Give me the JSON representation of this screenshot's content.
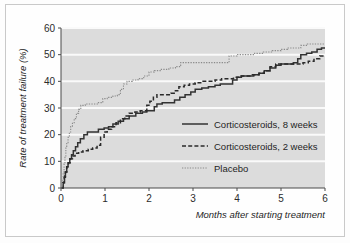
{
  "chart_data": {
    "type": "line",
    "subtype": "kaplan-meier-step",
    "title": "",
    "xlabel": "Months after starting treatment",
    "ylabel": "Rate of treatment failure (%)",
    "xlim": [
      0,
      6
    ],
    "ylim": [
      0,
      60
    ],
    "xticks": [
      0,
      1,
      2,
      3,
      4,
      5,
      6
    ],
    "yticks": [
      0,
      10,
      20,
      30,
      40,
      50,
      60
    ],
    "xtick_labels": [
      "0",
      "1",
      "2",
      "3",
      "4",
      "5",
      "6"
    ],
    "ytick_labels": [
      "0",
      "10",
      "20",
      "30",
      "40",
      "50",
      "60"
    ],
    "grid": "horizontal-white-on-gray",
    "legend_position": "inside-right-lower",
    "plot_background": "#dcdcdc",
    "gridline_color": "#fafafa",
    "series": [
      {
        "name": "Corticosteroids, 8 weeks",
        "style": "solid",
        "color": "#333333",
        "points": [
          [
            0.0,
            0.0
          ],
          [
            0.05,
            2.0
          ],
          [
            0.08,
            4.5
          ],
          [
            0.1,
            6.0
          ],
          [
            0.13,
            8.0
          ],
          [
            0.16,
            9.5
          ],
          [
            0.2,
            11.0
          ],
          [
            0.24,
            12.5
          ],
          [
            0.28,
            14.0
          ],
          [
            0.33,
            15.5
          ],
          [
            0.38,
            17.0
          ],
          [
            0.44,
            18.5
          ],
          [
            0.52,
            20.0
          ],
          [
            0.6,
            21.0
          ],
          [
            0.72,
            21.0
          ],
          [
            0.85,
            22.0
          ],
          [
            0.98,
            22.5
          ],
          [
            1.08,
            23.0
          ],
          [
            1.18,
            24.0
          ],
          [
            1.3,
            25.0
          ],
          [
            1.42,
            26.0
          ],
          [
            1.55,
            27.0
          ],
          [
            1.7,
            28.0
          ],
          [
            1.85,
            28.5
          ],
          [
            1.95,
            29.0
          ],
          [
            2.05,
            29.0
          ],
          [
            2.12,
            30.5
          ],
          [
            2.18,
            31.5
          ],
          [
            2.3,
            32.0
          ],
          [
            2.45,
            32.0
          ],
          [
            2.58,
            33.0
          ],
          [
            2.7,
            34.0
          ],
          [
            2.82,
            35.0
          ],
          [
            2.95,
            36.0
          ],
          [
            3.05,
            37.0
          ],
          [
            3.2,
            37.5
          ],
          [
            3.35,
            38.0
          ],
          [
            3.5,
            38.5
          ],
          [
            3.62,
            39.0
          ],
          [
            3.78,
            39.0
          ],
          [
            3.9,
            40.5
          ],
          [
            4.0,
            41.5
          ],
          [
            4.1,
            42.0
          ],
          [
            4.25,
            42.0
          ],
          [
            4.38,
            42.5
          ],
          [
            4.5,
            43.0
          ],
          [
            4.62,
            44.0
          ],
          [
            4.75,
            45.0
          ],
          [
            4.88,
            46.0
          ],
          [
            5.0,
            46.5
          ],
          [
            5.15,
            46.5
          ],
          [
            5.28,
            47.0
          ],
          [
            5.38,
            48.5
          ],
          [
            5.45,
            50.0
          ],
          [
            5.58,
            50.5
          ],
          [
            5.7,
            51.0
          ],
          [
            5.82,
            52.0
          ],
          [
            5.92,
            52.5
          ],
          [
            6.0,
            52.5
          ]
        ]
      },
      {
        "name": "Corticosteroids, 2 weeks",
        "style": "dashed",
        "color": "#2a2a2a",
        "points": [
          [
            0.0,
            0.0
          ],
          [
            0.04,
            2.0
          ],
          [
            0.07,
            4.0
          ],
          [
            0.1,
            6.0
          ],
          [
            0.13,
            8.0
          ],
          [
            0.17,
            9.5
          ],
          [
            0.21,
            11.0
          ],
          [
            0.26,
            12.0
          ],
          [
            0.32,
            13.0
          ],
          [
            0.4,
            13.5
          ],
          [
            0.5,
            14.0
          ],
          [
            0.62,
            14.5
          ],
          [
            0.72,
            15.0
          ],
          [
            0.82,
            16.0
          ],
          [
            0.9,
            19.0
          ],
          [
            0.98,
            21.0
          ],
          [
            1.05,
            22.0
          ],
          [
            1.15,
            23.0
          ],
          [
            1.25,
            24.5
          ],
          [
            1.35,
            26.0
          ],
          [
            1.45,
            27.0
          ],
          [
            1.55,
            28.0
          ],
          [
            1.68,
            28.5
          ],
          [
            1.8,
            29.0
          ],
          [
            1.88,
            29.0
          ],
          [
            1.95,
            31.0
          ],
          [
            2.02,
            32.5
          ],
          [
            2.1,
            34.0
          ],
          [
            2.18,
            35.0
          ],
          [
            2.35,
            35.0
          ],
          [
            2.5,
            35.5
          ],
          [
            2.6,
            36.5
          ],
          [
            2.68,
            38.0
          ],
          [
            2.8,
            38.5
          ],
          [
            2.92,
            39.0
          ],
          [
            3.05,
            39.5
          ],
          [
            3.2,
            40.0
          ],
          [
            3.35,
            40.0
          ],
          [
            3.5,
            40.5
          ],
          [
            3.65,
            41.0
          ],
          [
            3.8,
            41.0
          ],
          [
            3.92,
            41.5
          ],
          [
            4.05,
            42.0
          ],
          [
            4.2,
            42.0
          ],
          [
            4.35,
            42.5
          ],
          [
            4.5,
            43.0
          ],
          [
            4.62,
            44.0
          ],
          [
            4.75,
            45.5
          ],
          [
            4.88,
            46.5
          ],
          [
            5.0,
            46.5
          ],
          [
            5.18,
            46.5
          ],
          [
            5.35,
            46.5
          ],
          [
            5.5,
            47.0
          ],
          [
            5.62,
            47.5
          ],
          [
            5.75,
            48.5
          ],
          [
            5.88,
            49.5
          ],
          [
            6.0,
            49.5
          ]
        ]
      },
      {
        "name": "Placebo",
        "style": "dotted",
        "color": "#8a8a8a",
        "points": [
          [
            0.0,
            0.0
          ],
          [
            0.03,
            3.0
          ],
          [
            0.05,
            6.0
          ],
          [
            0.07,
            9.0
          ],
          [
            0.09,
            12.0
          ],
          [
            0.11,
            15.0
          ],
          [
            0.13,
            17.0
          ],
          [
            0.16,
            19.0
          ],
          [
            0.19,
            21.0
          ],
          [
            0.22,
            23.0
          ],
          [
            0.26,
            24.5
          ],
          [
            0.3,
            26.0
          ],
          [
            0.35,
            28.0
          ],
          [
            0.4,
            29.5
          ],
          [
            0.45,
            31.0
          ],
          [
            0.55,
            31.5
          ],
          [
            0.7,
            31.5
          ],
          [
            0.85,
            32.0
          ],
          [
            0.95,
            33.5
          ],
          [
            1.05,
            34.0
          ],
          [
            1.18,
            34.5
          ],
          [
            1.28,
            35.0
          ],
          [
            1.35,
            37.0
          ],
          [
            1.42,
            39.0
          ],
          [
            1.5,
            40.0
          ],
          [
            1.62,
            40.5
          ],
          [
            1.75,
            41.0
          ],
          [
            1.88,
            42.0
          ],
          [
            2.0,
            43.5
          ],
          [
            2.12,
            44.0
          ],
          [
            2.28,
            44.5
          ],
          [
            2.45,
            45.0
          ],
          [
            2.6,
            45.5
          ],
          [
            2.72,
            47.0
          ],
          [
            2.9,
            47.0
          ],
          [
            3.1,
            47.0
          ],
          [
            3.3,
            47.0
          ],
          [
            3.5,
            47.0
          ],
          [
            3.7,
            47.0
          ],
          [
            3.82,
            49.5
          ],
          [
            4.0,
            50.0
          ],
          [
            4.2,
            50.0
          ],
          [
            4.4,
            50.5
          ],
          [
            4.6,
            51.0
          ],
          [
            4.8,
            51.5
          ],
          [
            5.0,
            52.0
          ],
          [
            5.15,
            52.5
          ],
          [
            5.3,
            52.5
          ],
          [
            5.45,
            53.5
          ],
          [
            5.6,
            54.0
          ],
          [
            5.8,
            54.0
          ],
          [
            6.0,
            54.0
          ]
        ]
      }
    ]
  },
  "axes": {
    "y_title": "Rate of treatment failure (%)",
    "x_title": "Months after starting treatment",
    "y_ticks": [
      "60",
      "50",
      "40",
      "30",
      "20",
      "10",
      "0"
    ],
    "x_ticks": [
      "0",
      "1",
      "2",
      "3",
      "4",
      "5",
      "6"
    ]
  },
  "legend": {
    "items": [
      {
        "label": "Corticosteroids, 8 weeks",
        "style": "solid"
      },
      {
        "label": "Corticosteroids, 2 weeks",
        "style": "dashed"
      },
      {
        "label": "Placebo",
        "style": "dotted"
      }
    ]
  }
}
